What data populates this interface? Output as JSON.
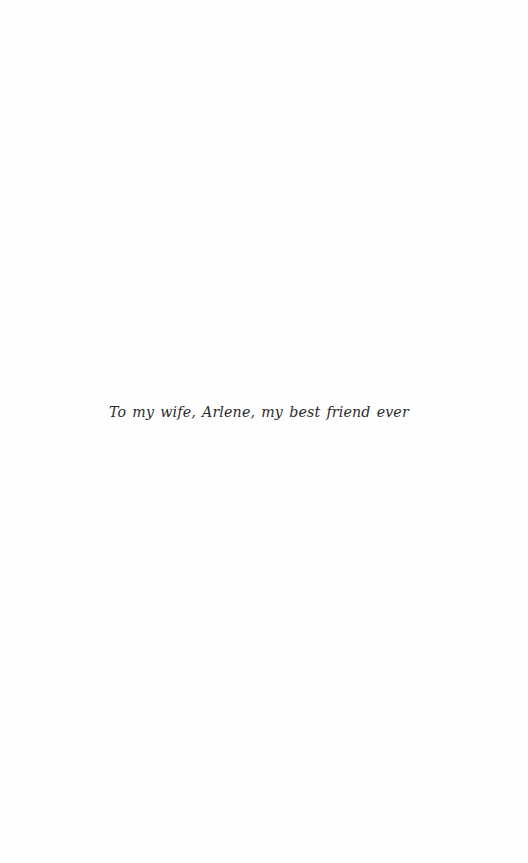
{
  "page": {
    "type": "dedication",
    "dedication_text": "To my wife, Arlene, my best friend ever"
  },
  "colors": {
    "background": "#fefefe",
    "text": "#2b2b2b"
  }
}
